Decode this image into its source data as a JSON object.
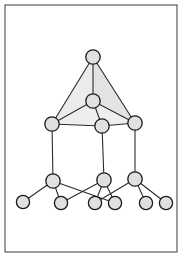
{
  "figure": {
    "canvas": {
      "width": 185,
      "height": 257
    },
    "colors": {
      "background": "#ffffff",
      "frame_stroke": "#3a3a3a",
      "node_fill": "#e0e0e0",
      "node_stroke": "#1a1a1a",
      "edge_stroke": "#2b2b2b",
      "face_fill_light": "#ececec",
      "face_fill_mid": "#e3e3e3"
    },
    "frame": {
      "x": 5,
      "y": 5,
      "width": 172,
      "height": 247
    },
    "node_radius": 7.2,
    "small_node_radius": 6.6,
    "nodes": [
      {
        "id": "n0",
        "name": "apex-node",
        "cx": 93,
        "cy": 57,
        "r": 7.2,
        "tier": 0
      },
      {
        "id": "n1",
        "name": "inner-apex-node",
        "cx": 93,
        "cy": 101,
        "r": 7.2,
        "tier": 1
      },
      {
        "id": "n2",
        "name": "mid-left-node",
        "cx": 52,
        "cy": 124,
        "r": 7.2,
        "tier": 2
      },
      {
        "id": "n3",
        "name": "mid-center-node",
        "cx": 102,
        "cy": 126,
        "r": 7.2,
        "tier": 2
      },
      {
        "id": "n4",
        "name": "mid-right-node",
        "cx": 135,
        "cy": 123,
        "r": 7.2,
        "tier": 2
      },
      {
        "id": "n5",
        "name": "low-left-node",
        "cx": 53,
        "cy": 181,
        "r": 7.2,
        "tier": 3
      },
      {
        "id": "n6",
        "name": "low-center-node",
        "cx": 104,
        "cy": 180,
        "r": 7.2,
        "tier": 3
      },
      {
        "id": "n7",
        "name": "low-right-node",
        "cx": 135,
        "cy": 179,
        "r": 7.2,
        "tier": 3
      },
      {
        "id": "n8",
        "name": "leaf-node-1",
        "cx": 23,
        "cy": 202,
        "r": 6.6,
        "tier": 4
      },
      {
        "id": "n9",
        "name": "leaf-node-2",
        "cx": 61,
        "cy": 203,
        "r": 6.6,
        "tier": 4
      },
      {
        "id": "n10",
        "name": "leaf-node-3",
        "cx": 95,
        "cy": 203,
        "r": 6.6,
        "tier": 4
      },
      {
        "id": "n11",
        "name": "leaf-node-4",
        "cx": 115,
        "cy": 203,
        "r": 6.6,
        "tier": 4
      },
      {
        "id": "n12",
        "name": "leaf-node-5",
        "cx": 146,
        "cy": 203,
        "r": 6.6,
        "tier": 4
      },
      {
        "id": "n13",
        "name": "leaf-node-6",
        "cx": 166,
        "cy": 203,
        "r": 6.6,
        "tier": 4
      }
    ],
    "faces": [
      {
        "name": "apex-left-face",
        "points": "93,57 52,124 93,101",
        "fill": "#ececec"
      },
      {
        "name": "apex-right-face",
        "points": "93,57 135,123 93,101",
        "fill": "#e3e3e3"
      },
      {
        "name": "apex-front-face",
        "points": "52,124 93,101 135,123 102,126",
        "fill": "#eeeeee"
      }
    ],
    "edges": [
      {
        "name": "edge-apex-inner",
        "from": "n0",
        "to": "n1"
      },
      {
        "name": "edge-apex-midleft",
        "from": "n0",
        "to": "n2"
      },
      {
        "name": "edge-apex-midright",
        "from": "n0",
        "to": "n4"
      },
      {
        "name": "edge-inner-midleft",
        "from": "n1",
        "to": "n2"
      },
      {
        "name": "edge-inner-midcenter",
        "from": "n1",
        "to": "n3"
      },
      {
        "name": "edge-inner-midright",
        "from": "n1",
        "to": "n4"
      },
      {
        "name": "edge-midleft-midcenter",
        "from": "n2",
        "to": "n3"
      },
      {
        "name": "edge-midcenter-midright",
        "from": "n3",
        "to": "n4"
      },
      {
        "name": "edge-midleft-lowleft",
        "from": "n2",
        "to": "n5"
      },
      {
        "name": "edge-midcenter-lowcent",
        "from": "n3",
        "to": "n6"
      },
      {
        "name": "edge-midright-lowright",
        "from": "n4",
        "to": "n7"
      },
      {
        "name": "edge-lowleft-leaf1",
        "from": "n5",
        "to": "n8"
      },
      {
        "name": "edge-lowleft-leaf2",
        "from": "n5",
        "to": "n9"
      },
      {
        "name": "edge-lowleft-leaf4",
        "from": "n5",
        "to": "n11"
      },
      {
        "name": "edge-lowcenter-leaf3",
        "from": "n6",
        "to": "n10"
      },
      {
        "name": "edge-lowcenter-leaf4",
        "from": "n6",
        "to": "n11"
      },
      {
        "name": "edge-lowcenter-leaf2",
        "from": "n6",
        "to": "n9"
      },
      {
        "name": "edge-lowright-leaf3",
        "from": "n7",
        "to": "n10"
      },
      {
        "name": "edge-lowright-leaf5",
        "from": "n7",
        "to": "n12"
      },
      {
        "name": "edge-lowright-leaf6",
        "from": "n7",
        "to": "n13"
      }
    ]
  }
}
